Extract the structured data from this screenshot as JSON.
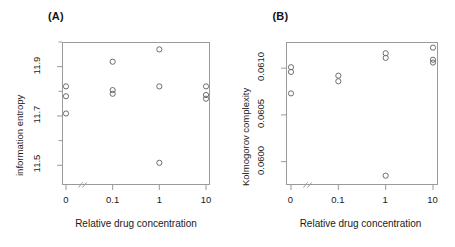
{
  "figure": {
    "caption_a": "(A)",
    "caption_b": "(B)",
    "xlabel": "Relative drug concentration",
    "axis_break_marker": "//"
  },
  "chart_data": [
    {
      "type": "scatter",
      "panel": "(A)",
      "title": "",
      "xlabel": "Relative drug concentration",
      "ylabel": "information entropy",
      "x_categories": [
        "0",
        "0.1",
        "1",
        "10"
      ],
      "x_tick_labels": [
        "0",
        "0.1",
        "1",
        "10"
      ],
      "y_tick_labels": [
        "11.5",
        "11.7",
        "11.9"
      ],
      "y_tick_values": [
        11.5,
        11.7,
        11.9
      ],
      "y_minor_ticks": [
        11.4,
        11.6,
        11.8,
        12.0
      ],
      "ylim": [
        11.42,
        12.0
      ],
      "grid": false,
      "legend": null,
      "marker": "open-circle",
      "points": [
        {
          "x_category": "0",
          "x_index": 0,
          "y": 11.82
        },
        {
          "x_category": "0",
          "x_index": 0,
          "y": 11.78
        },
        {
          "x_category": "0",
          "x_index": 0,
          "y": 11.71
        },
        {
          "x_category": "0.1",
          "x_index": 1,
          "y": 11.92
        },
        {
          "x_category": "0.1",
          "x_index": 1,
          "y": 11.805
        },
        {
          "x_category": "0.1",
          "x_index": 1,
          "y": 11.79
        },
        {
          "x_category": "1",
          "x_index": 2,
          "y": 11.97
        },
        {
          "x_category": "1",
          "x_index": 2,
          "y": 11.82
        },
        {
          "x_category": "1",
          "x_index": 2,
          "y": 11.51
        },
        {
          "x_category": "10",
          "x_index": 3,
          "y": 11.82
        },
        {
          "x_category": "10",
          "x_index": 3,
          "y": 11.785
        },
        {
          "x_category": "10",
          "x_index": 3,
          "y": 11.77
        }
      ]
    },
    {
      "type": "scatter",
      "panel": "(B)",
      "title": "",
      "xlabel": "Relative drug concentration",
      "ylabel": "Kolmogorov complexity",
      "x_categories": [
        "0",
        "0.1",
        "1",
        "10"
      ],
      "x_tick_labels": [
        "0",
        "0.1",
        "1",
        "10"
      ],
      "y_tick_labels": [
        "0.0600",
        "0.0605",
        "0.0610"
      ],
      "y_tick_values": [
        0.06,
        0.0605,
        0.061
      ],
      "ylim": [
        0.05975,
        0.06128
      ],
      "grid": false,
      "legend": null,
      "marker": "open-circle",
      "points": [
        {
          "x_category": "0",
          "x_index": 0,
          "y": 0.06101
        },
        {
          "x_category": "0",
          "x_index": 0,
          "y": 0.06096
        },
        {
          "x_category": "0",
          "x_index": 0,
          "y": 0.06073
        },
        {
          "x_category": "0.1",
          "x_index": 1,
          "y": 0.06092
        },
        {
          "x_category": "0.1",
          "x_index": 1,
          "y": 0.06086
        },
        {
          "x_category": "1",
          "x_index": 2,
          "y": 0.06116
        },
        {
          "x_category": "1",
          "x_index": 2,
          "y": 0.06111
        },
        {
          "x_category": "1",
          "x_index": 2,
          "y": 0.05985
        },
        {
          "x_category": "10",
          "x_index": 3,
          "y": 0.06122
        },
        {
          "x_category": "10",
          "x_index": 3,
          "y": 0.06109
        },
        {
          "x_category": "10",
          "x_index": 3,
          "y": 0.06106
        }
      ]
    }
  ]
}
